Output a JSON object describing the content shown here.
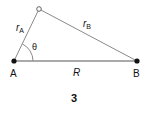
{
  "diagram": {
    "figure_number": "3",
    "points": {
      "A": {
        "label": "A"
      },
      "B": {
        "label": "B"
      },
      "apex": {
        "label": ""
      }
    },
    "edges": {
      "r_A": {
        "symbol": "r",
        "subscript": "A"
      },
      "r_B": {
        "symbol": "r",
        "subscript": "B"
      },
      "R": {
        "label": "R"
      }
    },
    "angle": {
      "label": "θ"
    },
    "colors": {
      "line": "#8a8a8a",
      "base_line": "#555555",
      "point": "#111111",
      "text": "#111111"
    }
  }
}
